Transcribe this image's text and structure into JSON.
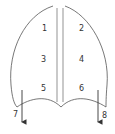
{
  "diagram": {
    "regions": [
      {
        "id": "1",
        "label": "1",
        "x": 42,
        "y": 31
      },
      {
        "id": "2",
        "label": "2",
        "x": 79,
        "y": 31
      },
      {
        "id": "3",
        "label": "3",
        "x": 42,
        "y": 62
      },
      {
        "id": "4",
        "label": "4",
        "x": 79,
        "y": 62
      },
      {
        "id": "5",
        "label": "5",
        "x": 42,
        "y": 91
      },
      {
        "id": "6",
        "label": "6",
        "x": 79,
        "y": 91
      }
    ],
    "arrows": [
      {
        "id": "7",
        "label": "7",
        "x": 15,
        "y": 117
      },
      {
        "id": "8",
        "label": "8",
        "x": 104,
        "y": 118
      }
    ],
    "line_color": "#444444"
  }
}
